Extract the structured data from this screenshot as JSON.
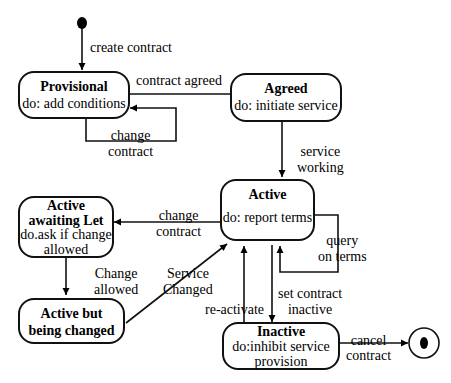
{
  "diagram": {
    "type": "UML state machine",
    "states": [
      {
        "id": "provisional",
        "name": "Provisional",
        "activity": "do: add conditions"
      },
      {
        "id": "agreed",
        "name": "Agreed",
        "activity": "do: initiate service"
      },
      {
        "id": "active",
        "name": "Active",
        "activity": "do: report terms"
      },
      {
        "id": "active_awaiting",
        "name": "Active awaiting Let",
        "name_lines": [
          "Active",
          "awaiting Let"
        ],
        "activity": "do.ask if change allowed",
        "activity_lines": [
          "do.ask if change",
          "allowed"
        ]
      },
      {
        "id": "active_changing",
        "name": "Active but being changed",
        "name_lines": [
          "Active but",
          "being changed"
        ]
      },
      {
        "id": "inactive",
        "name": "Inactive",
        "activity": "do:inhibit service provision",
        "activity_lines": [
          "do:inhibit service",
          "provision"
        ]
      }
    ],
    "transitions": [
      {
        "from": "initial",
        "to": "provisional",
        "label": "create contract"
      },
      {
        "from": "provisional",
        "to": "agreed",
        "label": "contract agreed"
      },
      {
        "from": "provisional",
        "to": "provisional",
        "label": "change contract",
        "lines": [
          "change",
          "contract"
        ]
      },
      {
        "from": "agreed",
        "to": "active",
        "label": "service working",
        "lines": [
          "service",
          "working"
        ]
      },
      {
        "from": "active",
        "to": "active_awaiting",
        "label": "change contract",
        "lines": [
          "change",
          "contract"
        ]
      },
      {
        "from": "active",
        "to": "active",
        "label": "query on terms",
        "lines": [
          "query",
          "on terms"
        ]
      },
      {
        "from": "active_awaiting",
        "to": "active_changing",
        "label": "Change allowed",
        "lines": [
          "Change",
          "allowed"
        ]
      },
      {
        "from": "active_changing",
        "to": "active",
        "label": "Service Changed",
        "lines": [
          "Service",
          "Changed"
        ]
      },
      {
        "from": "inactive",
        "to": "active",
        "label": "re-activate"
      },
      {
        "from": "active",
        "to": "inactive",
        "label": "set contract inactive",
        "lines": [
          "set contract",
          "inactive"
        ]
      },
      {
        "from": "inactive",
        "to": "final",
        "label": "cancel contract",
        "lines": [
          "cancel",
          "contract"
        ]
      }
    ]
  }
}
